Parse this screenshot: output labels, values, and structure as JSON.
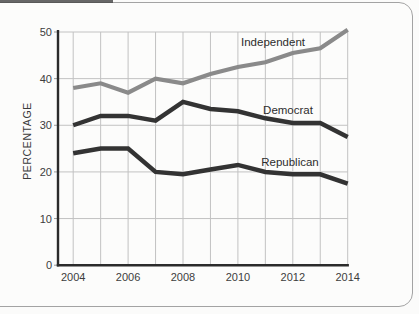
{
  "chart_data": {
    "type": "line",
    "title": "",
    "ylabel": "PERCENTAGE",
    "xlabel": "",
    "x": [
      2004,
      2005,
      2006,
      2007,
      2008,
      2009,
      2010,
      2011,
      2012,
      2013,
      2014
    ],
    "x_tick_labels": [
      "2004",
      "2006",
      "2008",
      "2010",
      "2012",
      "2014"
    ],
    "y_tick_labels": [
      "0",
      "10",
      "20",
      "30",
      "40",
      "50"
    ],
    "ylim": [
      0,
      50
    ],
    "grid": "on",
    "legend_position": "inline-labels",
    "series": [
      {
        "name": "Independent",
        "color": "#8a8a8a",
        "values": [
          38,
          39,
          37,
          40,
          39,
          41,
          42.5,
          43.5,
          45.5,
          46.5,
          50.5
        ]
      },
      {
        "name": "Democrat",
        "color": "#333333",
        "values": [
          30,
          32,
          32,
          31,
          35,
          33.5,
          33,
          31.5,
          30.5,
          30.5,
          27.5
        ]
      },
      {
        "name": "Republican",
        "color": "#333333",
        "values": [
          24,
          25,
          25,
          20,
          19.5,
          20.5,
          21.5,
          20,
          19.5,
          19.5,
          17.5
        ]
      }
    ],
    "colors": {
      "gridline": "#c2c2c2",
      "axis": "#2b2b2b",
      "tick_text": "#3d3d3d",
      "frame_border": "#a3a3a3",
      "background": "#fcfcfb"
    }
  }
}
